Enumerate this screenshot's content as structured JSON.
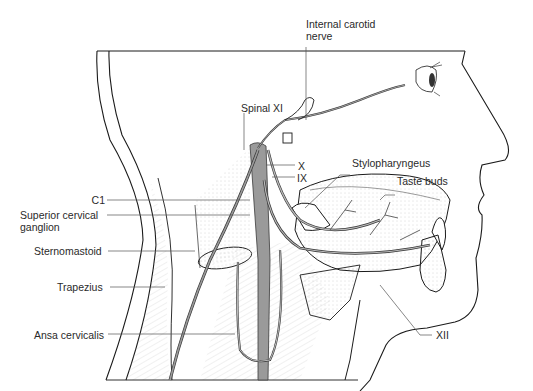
{
  "figure": {
    "colors": {
      "line": "#1a1a1a",
      "nerve_fill": "#9a9a9a",
      "nerve_stroke": "#3a3a3a",
      "stipple": "#b0b0b0",
      "leader": "#555555",
      "background": "#ffffff"
    }
  },
  "labels": {
    "internal_carotid_nerve_line1": "Internal carotid",
    "internal_carotid_nerve_line2": "nerve",
    "spinal_xi": "Spinal XI",
    "x": "X",
    "ix": "IX",
    "stylopharyngeus": "Stylopharyngeus",
    "taste_buds": "Taste buds",
    "c1": "C1",
    "superior_cervical_ganglion_line1": "Superior cervical",
    "superior_cervical_ganglion_line2": "ganglion",
    "sternomastoid": "Sternomastoid",
    "trapezius": "Trapezius",
    "ansa_cervicalis": "Ansa cervicalis",
    "xii": "XII"
  }
}
